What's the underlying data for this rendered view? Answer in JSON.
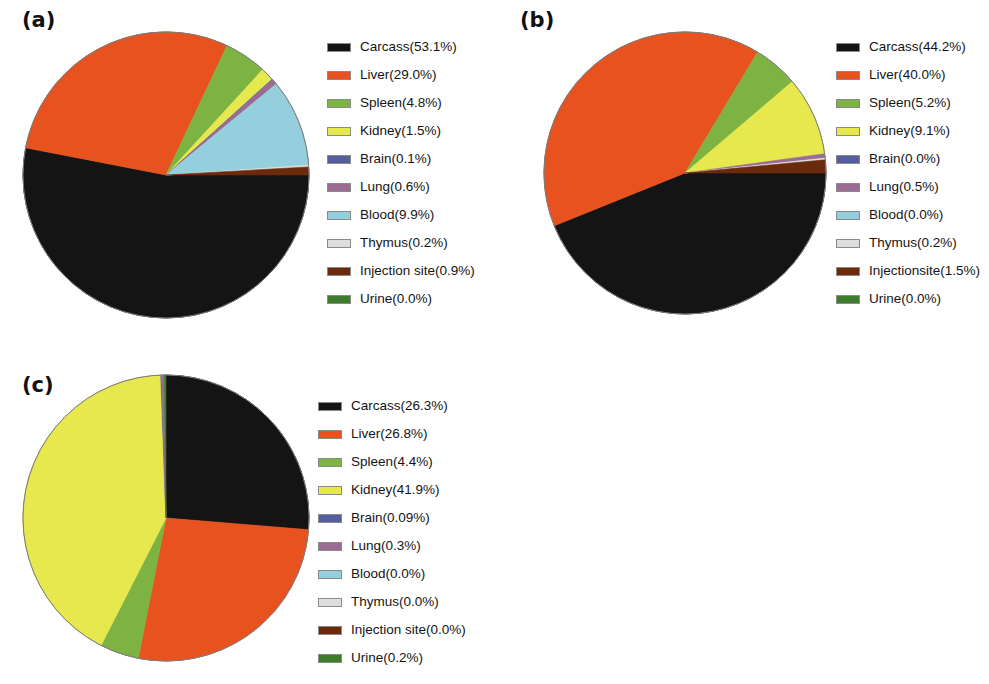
{
  "figure": {
    "background": "#ffffff",
    "panel_labels": [
      "(a)",
      "(b)",
      "(c)"
    ]
  },
  "palette": {
    "carcass": "#141414",
    "liver": "#E8521E",
    "spleen": "#7CB342",
    "kidney": "#E6E84E",
    "brain": "#555F9E",
    "lung": "#9B6B94",
    "blood": "#95CEDD",
    "thymus": "#DEDEDE",
    "injection_site": "#6B2A0C",
    "urine": "#3C7C2B"
  },
  "chart_data": [
    {
      "type": "pie",
      "panel": "(a)",
      "title": "",
      "start_angle_deg": 0,
      "direction": "clockwise",
      "categories": [
        "Carcass",
        "Liver",
        "Spleen",
        "Kidney",
        "Brain",
        "Lung",
        "Blood",
        "Thymus",
        "Injection site",
        "Urine"
      ],
      "values": [
        53.1,
        29.0,
        4.8,
        1.5,
        0.1,
        0.6,
        9.9,
        0.2,
        0.9,
        0.0
      ],
      "colors": [
        "#141414",
        "#E8521E",
        "#7CB342",
        "#E6E84E",
        "#555F9E",
        "#9B6B94",
        "#95CEDD",
        "#DEDEDE",
        "#6B2A0C",
        "#3C7C2B"
      ],
      "legend_position": "right",
      "legend_entries": [
        "Carcass(53.1%)",
        "Liver(29.0%)",
        "Spleen(4.8%)",
        "Kidney(1.5%)",
        "Brain(0.1%)",
        "Lung(0.6%)",
        "Blood(9.9%)",
        "Thymus(0.2%)",
        "Injection site(0.9%)",
        "Urine(0.0%)"
      ]
    },
    {
      "type": "pie",
      "panel": "(b)",
      "title": "",
      "start_angle_deg": 0,
      "direction": "clockwise",
      "categories": [
        "Carcass",
        "Liver",
        "Spleen",
        "Kidney",
        "Brain",
        "Lung",
        "Blood",
        "Thymus",
        "Injectionsite",
        "Urine"
      ],
      "values": [
        44.2,
        40.0,
        5.2,
        9.1,
        0.0,
        0.5,
        0.0,
        0.2,
        1.5,
        0.0
      ],
      "colors": [
        "#141414",
        "#E8521E",
        "#7CB342",
        "#E6E84E",
        "#555F9E",
        "#9B6B94",
        "#95CEDD",
        "#DEDEDE",
        "#6B2A0C",
        "#3C7C2B"
      ],
      "legend_position": "right",
      "legend_entries": [
        "Carcass(44.2%)",
        "Liver(40.0%)",
        "Spleen(5.2%)",
        "Kidney(9.1%)",
        "Brain(0.0%)",
        "Lung(0.5%)",
        "Blood(0.0%)",
        "Thymus(0.2%)",
        "Injectionsite(1.5%)",
        "Urine(0.0%)"
      ]
    },
    {
      "type": "pie",
      "panel": "(c)",
      "title": "",
      "start_angle_deg": -90,
      "direction": "clockwise",
      "categories": [
        "Carcass",
        "Liver",
        "Spleen",
        "Kidney",
        "Brain",
        "Lung",
        "Blood",
        "Thymus",
        "Injection site",
        "Urine"
      ],
      "values": [
        26.3,
        26.8,
        4.4,
        41.9,
        0.09,
        0.3,
        0.0,
        0.0,
        0.0,
        0.2
      ],
      "colors": [
        "#141414",
        "#E8521E",
        "#7CB342",
        "#E6E84E",
        "#555F9E",
        "#9B6B94",
        "#95CEDD",
        "#DEDEDE",
        "#6B2A0C",
        "#3C7C2B"
      ],
      "legend_position": "right",
      "legend_entries": [
        "Carcass(26.3%)",
        "Liver(26.8%)",
        "Spleen(4.4%)",
        "Kidney(41.9%)",
        "Brain(0.09%)",
        "Lung(0.3%)",
        "Blood(0.0%)",
        "Thymus(0.0%)",
        "Injection site(0.0%)",
        "Urine(0.2%)"
      ]
    }
  ]
}
